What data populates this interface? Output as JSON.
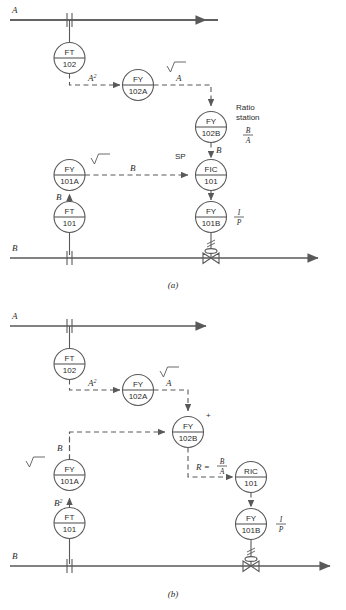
{
  "figure": {
    "stroke_color": "#595959",
    "text_color": "#2b2b2b"
  },
  "panels": [
    {
      "id": "a",
      "caption": "(a)",
      "streams": {
        "top_label": "A",
        "bottom_label": "B"
      },
      "instruments": [
        {
          "name": "ft-102",
          "line1": "FT",
          "line2": "102"
        },
        {
          "name": "fy-102a",
          "line1": "FY",
          "line2": "102A"
        },
        {
          "name": "fy-102b",
          "line1": "FY",
          "line2": "102B"
        },
        {
          "name": "fic-101",
          "line1": "FIC",
          "line2": "101"
        },
        {
          "name": "fy-101a",
          "line1": "FY",
          "line2": "101A"
        },
        {
          "name": "ft-101",
          "line1": "FT",
          "line2": "101"
        },
        {
          "name": "fy-101b",
          "line1": "FY",
          "line2": "101B"
        }
      ],
      "signal_labels": {
        "a_squared": "A",
        "a_squared_exp": "2",
        "a_out": "A",
        "b_from_ratio": "B",
        "b_measured": "B",
        "b_to_fy101a": "B",
        "setpoint": "SP"
      },
      "annotations": {
        "ratio_station_line1": "Ratio",
        "ratio_station_line2": "station",
        "ratio_numerator": "B",
        "ratio_denominator": "A",
        "ip_numerator": "I",
        "ip_denominator": "P",
        "sqrt_symbol": "√"
      }
    },
    {
      "id": "b",
      "caption": "(b)",
      "streams": {
        "top_label": "A",
        "bottom_label": "B"
      },
      "instruments": [
        {
          "name": "ft-102",
          "line1": "FT",
          "line2": "102"
        },
        {
          "name": "fy-102a",
          "line1": "FY",
          "line2": "102A"
        },
        {
          "name": "fy-102b",
          "line1": "FY",
          "line2": "102B"
        },
        {
          "name": "ric-101",
          "line1": "RIC",
          "line2": "101"
        },
        {
          "name": "fy-101a",
          "line1": "FY",
          "line2": "101A"
        },
        {
          "name": "ft-101",
          "line1": "FT",
          "line2": "101"
        },
        {
          "name": "fy-101b",
          "line1": "FY",
          "line2": "101B"
        }
      ],
      "signal_labels": {
        "a_squared": "A",
        "a_squared_exp": "2",
        "a_out": "A",
        "b_to_fy102b": "B",
        "b_squared": "B",
        "b_squared_exp": "2",
        "divider_sign": "+"
      },
      "annotations": {
        "ratio_eq_prefix": "R =",
        "ratio_numerator": "B",
        "ratio_denominator": "A",
        "ip_numerator": "I",
        "ip_denominator": "P",
        "sqrt_symbol": "√"
      }
    }
  ]
}
